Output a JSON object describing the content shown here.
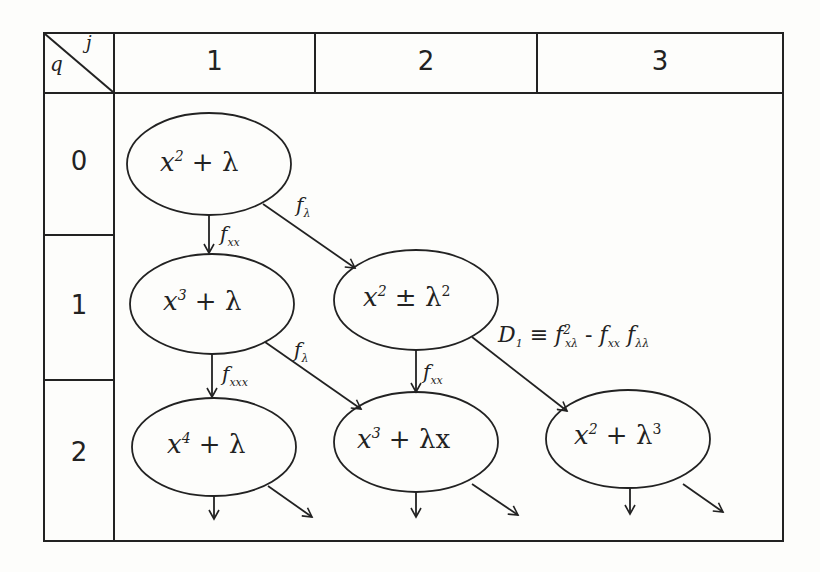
{
  "table": {
    "corner": {
      "row_var": "q",
      "col_var": "j"
    },
    "columns": [
      "1",
      "2",
      "3"
    ],
    "rows": [
      "0",
      "1",
      "2"
    ]
  },
  "nodes": [
    {
      "id": "n00",
      "q": "0",
      "j": "1",
      "base": "x",
      "exp": "2",
      "rest": "+ λ"
    },
    {
      "id": "n11",
      "q": "1",
      "j": "1",
      "base": "x",
      "exp": "3",
      "rest": "+ λ"
    },
    {
      "id": "n12",
      "q": "1",
      "j": "2",
      "base": "x",
      "exp": "2",
      "rest": "± λ",
      "rest_exp": "2"
    },
    {
      "id": "n21",
      "q": "2",
      "j": "1",
      "base": "x",
      "exp": "4",
      "rest": "+ λ"
    },
    {
      "id": "n22",
      "q": "2",
      "j": "2",
      "base": "x",
      "exp": "3",
      "rest": "+ λx"
    },
    {
      "id": "n23",
      "q": "2",
      "j": "3",
      "base": "x",
      "exp": "2",
      "rest": "+ λ",
      "rest_exp": "3"
    }
  ],
  "edges": [
    {
      "from": "n00",
      "to": "n11",
      "label": "f",
      "sub": "xx"
    },
    {
      "from": "n00",
      "to": "n12",
      "label": "f",
      "sub": "λ"
    },
    {
      "from": "n11",
      "to": "n21",
      "label": "f",
      "sub": "xxx"
    },
    {
      "from": "n11",
      "to": "n22",
      "label": "f",
      "sub": "λ"
    },
    {
      "from": "n12",
      "to": "n22",
      "label": "f",
      "sub": "xx"
    },
    {
      "from": "n12",
      "to": "n23",
      "label": "D₁ ≡ f²ₓλ − fₓₓ fλλ"
    }
  ],
  "annotation": {
    "d1": {
      "lhs": "D",
      "lhs_sub": "1",
      "eq": "≡",
      "t1": "f",
      "t1_sup": "2",
      "t1_sub": "xλ",
      "minus": "-",
      "t2": "f",
      "t2_sub": "xx",
      "t3": "f",
      "t3_sub": "λλ"
    }
  }
}
